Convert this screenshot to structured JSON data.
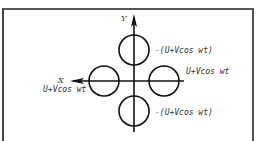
{
  "diagram": {
    "axes": {
      "x_label": "X",
      "y_label": "Y"
    },
    "circles": [
      {
        "id": "top",
        "label": "-(U+Vcos wt)"
      },
      {
        "id": "right",
        "label": "U+Vcos wt"
      },
      {
        "id": "left",
        "label": "U+Vcos wt"
      },
      {
        "id": "bottom",
        "label": "-(U+Vcos wt)"
      }
    ],
    "colors": {
      "stroke": "#111111",
      "text": "#333333",
      "frame": "#555555",
      "background": "#ffffff"
    }
  }
}
